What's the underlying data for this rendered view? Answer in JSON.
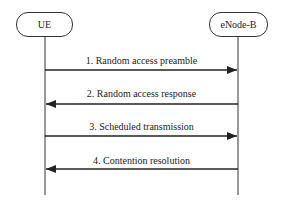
{
  "diagram": {
    "type": "sequence",
    "entities": [
      {
        "label": "UE"
      },
      {
        "label": "eNode-B"
      }
    ],
    "messages": [
      {
        "label": "1. Random access preamble",
        "direction": "UE->eNode-B"
      },
      {
        "label": "2. Random access response",
        "direction": "eNode-B->UE"
      },
      {
        "label": "3. Scheduled transmission",
        "direction": "UE->eNode-B"
      },
      {
        "label": "4. Contention resolution",
        "direction": "eNode-B->UE"
      }
    ],
    "colors": {
      "line": "#333333",
      "text": "#222222"
    }
  }
}
